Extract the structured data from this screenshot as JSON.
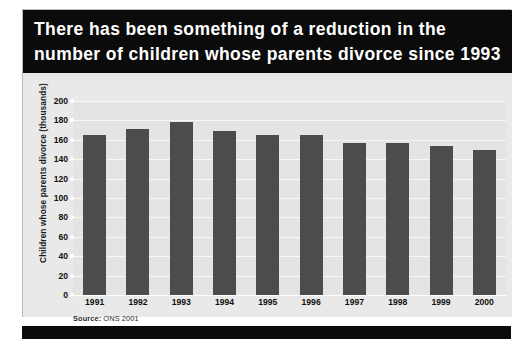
{
  "header": {
    "line1": "There has been something of a reduction in the",
    "line2": "number of children whose parents divorce since 1993"
  },
  "source": {
    "prefix": "Source:",
    "text": " ONS 2001"
  },
  "colors": {
    "header_background": "#0b0b0b",
    "bar": "#4c4c4c",
    "plot_background": "#e4e4e4",
    "panel_background": "#e9e9e9",
    "gridline": "#f7f7f7"
  },
  "chart_data": {
    "type": "bar",
    "title": "There has been something of a reduction in the number of children whose parents divorce since 1993",
    "xlabel": "",
    "ylabel": "Children whose parents divorce (thousands)",
    "categories": [
      "1991",
      "1992",
      "1993",
      "1994",
      "1995",
      "1996",
      "1997",
      "1998",
      "1999",
      "2000"
    ],
    "values": [
      165,
      171,
      178,
      169,
      165,
      165,
      157,
      157,
      154,
      150
    ],
    "ylim": [
      0,
      200
    ],
    "yticks": [
      0,
      20,
      40,
      60,
      80,
      100,
      120,
      140,
      160,
      180,
      200
    ],
    "ytick_labels": [
      "0",
      "20",
      "40",
      "60",
      "80",
      "100",
      "120",
      "140",
      "160",
      "180",
      "200"
    ],
    "grid": true,
    "legend": false,
    "source": "Source: ONS 2001"
  }
}
